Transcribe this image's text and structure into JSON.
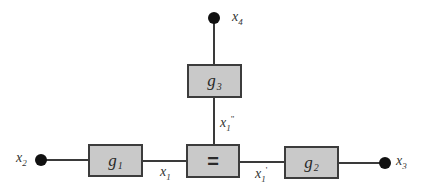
{
  "diagram": {
    "type": "factor-graph",
    "colors": {
      "box_fill": "#c9c9c9",
      "box_border": "#3c3c3c",
      "edge": "#3a3a3a",
      "terminal": "#111111",
      "label": "#333333"
    },
    "nodes": {
      "g1": {
        "base": "g",
        "sub": "1"
      },
      "g2": {
        "base": "g",
        "sub": "2"
      },
      "g3": {
        "base": "g",
        "sub": "3"
      },
      "equality": {
        "symbol": "="
      }
    },
    "terminals": {
      "x2": {
        "base": "x",
        "sub": "2"
      },
      "x3": {
        "base": "x",
        "sub": "3"
      },
      "x4": {
        "base": "x",
        "sub": "4"
      }
    },
    "edge_labels": {
      "x1": {
        "base": "x",
        "sub": "1",
        "prime": ""
      },
      "x1_prime": {
        "base": "x",
        "sub": "1",
        "prime": "'"
      },
      "x1_double_prime": {
        "base": "x",
        "sub": "1",
        "prime": "\""
      }
    },
    "edges": [
      {
        "from": "x2",
        "to": "g1"
      },
      {
        "from": "g1",
        "to": "equality",
        "label": "x1"
      },
      {
        "from": "equality",
        "to": "g2",
        "label": "x1'"
      },
      {
        "from": "g2",
        "to": "x3"
      },
      {
        "from": "equality",
        "to": "g3",
        "label": "x1\""
      },
      {
        "from": "g3",
        "to": "x4"
      }
    ]
  }
}
